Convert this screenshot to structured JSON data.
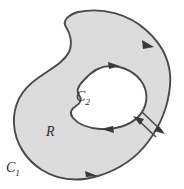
{
  "figure": {
    "type": "multiply-connected-region-diagram",
    "width": 184,
    "height": 189,
    "background_color": "#ffffff",
    "region_fill_color": "#dcdcdc",
    "hole_fill_color": "#ffffff",
    "stroke_color": "#4a4a4a",
    "label_color": "#2b2b2b"
  },
  "labels": {
    "region": {
      "text": "R",
      "base": "R",
      "subscript": "",
      "x": 46,
      "y": 136
    },
    "outer_curve": {
      "text": "C1",
      "base": "C",
      "subscript": "1",
      "x": 6,
      "y": 172
    },
    "inner_curve": {
      "text": "C2",
      "base": "C",
      "subscript": "2",
      "x": 76,
      "y": 101
    }
  },
  "curves": {
    "outer": {
      "name": "C1",
      "orientation": "counterclockwise",
      "arrow_count": 2,
      "arrows": [
        {
          "position": "upper-right",
          "direction": "up-left"
        },
        {
          "position": "bottom",
          "direction": "right"
        }
      ]
    },
    "inner": {
      "name": "C2",
      "orientation": "clockwise",
      "arrow_count": 2,
      "arrows": [
        {
          "position": "top",
          "direction": "right"
        },
        {
          "position": "bottom",
          "direction": "left"
        }
      ]
    }
  },
  "cut_lines": {
    "count": 2,
    "description": "parallel diagonal crosscut segments joining outer and inner boundary",
    "segments": [
      {
        "id": "cut-inbound",
        "direction": "up-left",
        "arrow_at": "inner-end"
      },
      {
        "id": "cut-outbound",
        "direction": "down-right",
        "arrow_at": "outer-end"
      }
    ]
  }
}
